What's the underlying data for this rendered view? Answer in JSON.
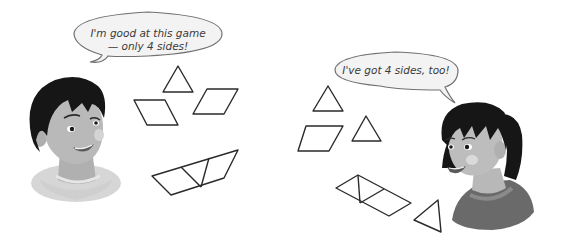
{
  "scene": {
    "description": "Two children playing a shape game with pattern blocks",
    "background_color": "#ffffff"
  },
  "characters": [
    {
      "id": "boy",
      "speech": {
        "line1": "I'm good at this game",
        "line2": "— only 4 sides!"
      }
    },
    {
      "id": "girl",
      "speech": {
        "line1": "I've got 4 sides, too!"
      }
    }
  ],
  "shapes": {
    "left_group": [
      "triangle",
      "rhombus",
      "rhombus",
      "trapezoid-of-rhombus-triangle-triangle-rhombus"
    ],
    "right_group": [
      "triangle",
      "rhombus",
      "triangle",
      "parallelogram-of-triangles",
      "triangle"
    ]
  },
  "colors": {
    "line": "#2a2a2a",
    "bubble_fill": "#f2f2f2",
    "bubble_stroke": "#6a6a6a",
    "hair": "#1a1a1a",
    "skin": "#b8b8b8",
    "shirt_boy": "#d8d8d8",
    "shirt_girl": "#6e6e6e"
  }
}
